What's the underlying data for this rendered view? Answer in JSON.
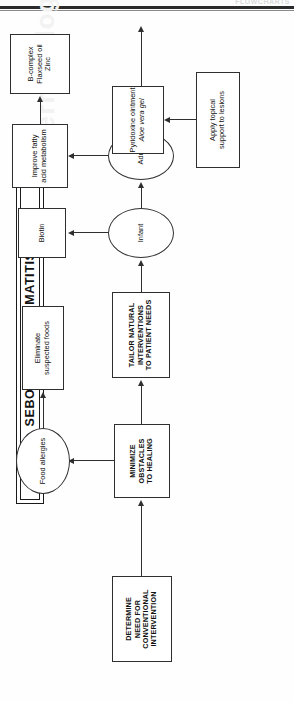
{
  "page": {
    "running_head": "FLOWCHARTS",
    "watermark": "Dermatology"
  },
  "chart_title": "SEBORRHEIC DERMATITIS",
  "nodes": {
    "title": "SEBORRHEIC DERMATITIS",
    "determine": "DETERMINE\nNEED FOR\nCONVENTIONAL\nINTERVENTION",
    "determine_lines": [
      "DETERMINE",
      "NEED FOR",
      "CONVENTIONAL",
      "INTERVENTION"
    ],
    "minimize_lines": [
      "MINIMIZE",
      "OBSTACLES",
      "TO HEALING"
    ],
    "tailor_lines": [
      "TAILOR NATURAL",
      "INTERVENTIONS",
      "TO PATIENT NEEDS"
    ],
    "food_allergies": "Food allergies",
    "eliminate_lines": [
      "Eliminate",
      "suspected foods"
    ],
    "infant": "Infant",
    "adult": "Adult",
    "biotin": "Biotin",
    "improve_lines": [
      "Improve fatty",
      "acid metabolism"
    ],
    "bcomplex_lines": [
      "B-complex",
      "Flaxseed oil",
      "Zinc"
    ],
    "apply_topical_lines": [
      "Apply topical",
      "support to lesions"
    ],
    "pyridoxine_line1": "Pyridoxine ointment",
    "pyridoxine_line2": "Aloe vera gel"
  },
  "edges": [
    {
      "from": "determine",
      "to": "minimize"
    },
    {
      "from": "minimize",
      "to": "food_allergies"
    },
    {
      "from": "food_allergies",
      "to": "eliminate"
    },
    {
      "from": "minimize",
      "to": "tailor"
    },
    {
      "from": "tailor",
      "to": "infant"
    },
    {
      "from": "infant",
      "to": "biotin"
    },
    {
      "from": "infant",
      "to": "adult"
    },
    {
      "from": "adult",
      "to": "improve"
    },
    {
      "from": "improve",
      "to": "bcomplex"
    },
    {
      "from": "adult",
      "to": "apply_topical"
    },
    {
      "from": "apply_topical",
      "to": "pyridoxine"
    }
  ],
  "colors": {
    "stroke": "#2f2f2f",
    "text": "#111111",
    "background": "#ffffff"
  }
}
